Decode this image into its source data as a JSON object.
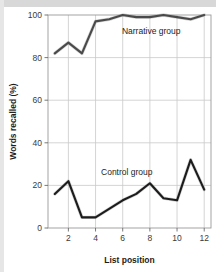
{
  "figure": {
    "background_color": "#ffffff",
    "top_band_color": "#d8d8d8",
    "left_band_color": "#e6e6e6"
  },
  "chart_data": {
    "type": "line",
    "title": "",
    "xlabel": "List position",
    "ylabel": "Words recalled (%)",
    "xlim": [
      0.5,
      12.5
    ],
    "ylim": [
      0,
      100
    ],
    "grid": true,
    "grid_color": "#c9c9c9",
    "legend_position": "inline-annotation",
    "xticks": [
      2,
      4,
      6,
      8,
      10,
      12
    ],
    "xtick_labels": [
      "2",
      "4",
      "6",
      "8",
      "10",
      "12"
    ],
    "yticks": [
      0,
      20,
      40,
      60,
      80,
      100
    ],
    "ytick_labels": [
      "0",
      "20",
      "40",
      "60",
      "80",
      "100"
    ],
    "x": [
      1,
      2,
      3,
      4,
      5,
      6,
      7,
      8,
      9,
      10,
      11,
      12
    ],
    "series": [
      {
        "name": "Narrative group",
        "color": "#4a4a4a",
        "label_x": 8.1,
        "label_y": 91,
        "values": [
          82,
          87,
          82,
          97,
          98,
          100,
          99,
          99,
          100,
          99,
          98,
          100
        ]
      },
      {
        "name": "Control group",
        "color": "#1c1c1c",
        "label_x": 6.3,
        "label_y": 25,
        "values": [
          16,
          22,
          5,
          5,
          9,
          13,
          16,
          21,
          14,
          13,
          32,
          18
        ]
      }
    ]
  }
}
